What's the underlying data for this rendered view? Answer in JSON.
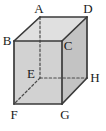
{
  "figure": {
    "name": "cube-diagram",
    "background_color": "#ffffff",
    "solid_edge_color": "#3a3a3a",
    "hidden_edge_color": "#4a4a4a",
    "face_front_color": "#d2d2d2",
    "face_right_color": "#c2c2c2",
    "face_top_color": "#e0e0e0",
    "label_color": "#1a1a1a",
    "projection": "oblique"
  },
  "vertices": [
    {
      "id": "A",
      "label": "A",
      "x": 40,
      "y": 17,
      "label_x": 39,
      "label_y": 13,
      "hidden": false,
      "role": "top-back-left"
    },
    {
      "id": "B",
      "label": "B",
      "x": 14,
      "y": 41,
      "label_x": 7,
      "label_y": 45,
      "hidden": false,
      "role": "top-front-left"
    },
    {
      "id": "C",
      "label": "C",
      "x": 62,
      "y": 41,
      "label_x": 68,
      "label_y": 50,
      "hidden": false,
      "role": "top-front-right"
    },
    {
      "id": "D",
      "label": "D",
      "x": 87,
      "y": 17,
      "label_x": 88,
      "label_y": 13,
      "hidden": false,
      "role": "top-back-right"
    },
    {
      "id": "E",
      "label": "E",
      "x": 40,
      "y": 78,
      "label_x": 31,
      "label_y": 78,
      "hidden": true,
      "role": "bottom-back-left"
    },
    {
      "id": "F",
      "label": "F",
      "x": 14,
      "y": 104,
      "label_x": 14,
      "label_y": 119,
      "hidden": false,
      "role": "bottom-front-left"
    },
    {
      "id": "G",
      "label": "G",
      "x": 62,
      "y": 104,
      "label_x": 65,
      "label_y": 119,
      "hidden": false,
      "role": "bottom-front-right"
    },
    {
      "id": "H",
      "label": "H",
      "x": 87,
      "y": 78,
      "label_x": 95,
      "label_y": 82,
      "hidden": false,
      "role": "bottom-back-right"
    }
  ],
  "faces": [
    {
      "id": "top",
      "name": "face-top-ABCD",
      "points": "40,17 87,17 62,41 14,41",
      "fill": "#e0e0e0"
    },
    {
      "id": "front",
      "name": "face-front-BCGF",
      "points": "14,41 62,41 62,104 14,104",
      "fill": "#d2d2d2"
    },
    {
      "id": "right",
      "name": "face-right-CDHG",
      "points": "62,41 87,17 87,78 62,104",
      "fill": "#c3c3c3"
    }
  ],
  "edges": [
    {
      "id": "AB",
      "from": "A",
      "to": "B",
      "style": "solid",
      "name": "edge-a-b"
    },
    {
      "id": "AD",
      "from": "A",
      "to": "D",
      "style": "solid",
      "name": "edge-a-d"
    },
    {
      "id": "BC",
      "from": "B",
      "to": "C",
      "style": "solid",
      "name": "edge-b-c"
    },
    {
      "id": "CD",
      "from": "C",
      "to": "D",
      "style": "solid",
      "name": "edge-c-d"
    },
    {
      "id": "BF",
      "from": "B",
      "to": "F",
      "style": "solid",
      "name": "edge-b-f"
    },
    {
      "id": "CG",
      "from": "C",
      "to": "G",
      "style": "solid",
      "name": "edge-c-g"
    },
    {
      "id": "DH",
      "from": "D",
      "to": "H",
      "style": "solid",
      "name": "edge-d-h"
    },
    {
      "id": "FG",
      "from": "F",
      "to": "G",
      "style": "solid",
      "name": "edge-f-g"
    },
    {
      "id": "GH",
      "from": "G",
      "to": "H",
      "style": "solid",
      "name": "edge-g-h"
    },
    {
      "id": "AE",
      "from": "A",
      "to": "E",
      "style": "dashed",
      "name": "edge-a-e-hidden"
    },
    {
      "id": "EH",
      "from": "E",
      "to": "H",
      "style": "dashed",
      "name": "edge-e-h-hidden"
    },
    {
      "id": "EF",
      "from": "E",
      "to": "F",
      "style": "dashed",
      "name": "edge-e-f-hidden"
    }
  ]
}
